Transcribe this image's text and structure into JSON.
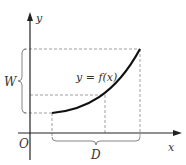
{
  "diagram": {
    "labels": {
      "y_axis": "y",
      "x_axis": "x",
      "origin": "O",
      "function": "y = f(x)",
      "width_brace": "W",
      "domain_brace": "D"
    },
    "colors": {
      "axis": "#222222",
      "curve": "#111111",
      "dashed": "#888888",
      "text": "#333333"
    }
  }
}
